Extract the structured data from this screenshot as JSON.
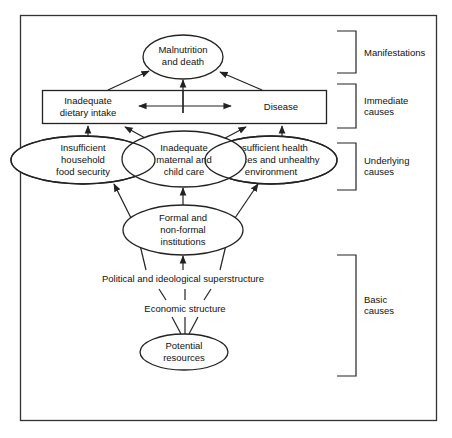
{
  "diagram": {
    "nodes": {
      "manifestation": {
        "lines": [
          "Malnutrition",
          "and death"
        ]
      },
      "immediate_left": {
        "lines": [
          "Inadequate",
          "dietary intake"
        ]
      },
      "immediate_right": {
        "lines": [
          "Disease"
        ]
      },
      "underlying_left": {
        "lines": [
          "Insufficient",
          "household",
          "food security"
        ]
      },
      "underlying_middle": {
        "lines": [
          "Inadequate",
          "maternal and",
          "child care"
        ]
      },
      "underlying_right": {
        "lines": [
          "Insufficient health",
          "services and unhealthy",
          "environment"
        ]
      },
      "institutions": {
        "lines": [
          "Formal and",
          "non-formal",
          "institutions"
        ]
      },
      "political": {
        "lines": [
          "Political and ideological superstructure"
        ]
      },
      "economic": {
        "lines": [
          "Economic structure"
        ]
      },
      "resources": {
        "lines": [
          "Potential",
          "resources"
        ]
      }
    },
    "levels": {
      "manifestations": {
        "lines": [
          "Manifestations"
        ]
      },
      "immediate": {
        "lines": [
          "Immediate",
          "causes"
        ]
      },
      "underlying": {
        "lines": [
          "Underlying",
          "causes"
        ]
      },
      "basic": {
        "lines": [
          "Basic",
          "causes"
        ]
      }
    },
    "edges": [
      {
        "from": "immediate_left",
        "to": "manifestation"
      },
      {
        "from": "immediate_box",
        "to": "manifestation"
      },
      {
        "from": "immediate_right",
        "to": "manifestation"
      },
      {
        "from": "immediate_left",
        "to": "immediate_right",
        "bidirectional": true
      },
      {
        "from": "underlying_left",
        "to": "immediate_left"
      },
      {
        "from": "underlying_middle",
        "to": "immediate_left"
      },
      {
        "from": "underlying_middle",
        "to": "immediate_right"
      },
      {
        "from": "underlying_right",
        "to": "immediate_right"
      },
      {
        "from": "institutions",
        "to": "underlying_left"
      },
      {
        "from": "institutions",
        "to": "underlying_middle"
      },
      {
        "from": "institutions",
        "to": "underlying_right"
      },
      {
        "from": "political",
        "to": "institutions"
      },
      {
        "from": "economic",
        "to": "political"
      },
      {
        "from": "resources",
        "to": "economic"
      }
    ],
    "colors": {
      "line": "#222222",
      "text": "#111111",
      "background": "#ffffff"
    }
  }
}
